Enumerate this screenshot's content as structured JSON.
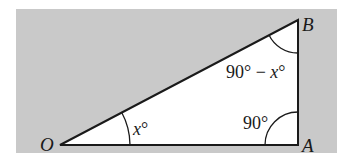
{
  "diagram": {
    "type": "right-triangle",
    "colors": {
      "background_panel": "#c9c9c9",
      "triangle_fill": "#ffffff",
      "stroke": "#1a1a1a"
    },
    "vertices": {
      "O": {
        "label": "O"
      },
      "A": {
        "label": "A"
      },
      "B": {
        "label": "B"
      }
    },
    "angles": {
      "at_O": {
        "var": "x",
        "deg": "°"
      },
      "at_A": {
        "value": "90°"
      },
      "at_B": {
        "prefix": "90° − ",
        "var": "x",
        "deg": "°"
      }
    }
  }
}
